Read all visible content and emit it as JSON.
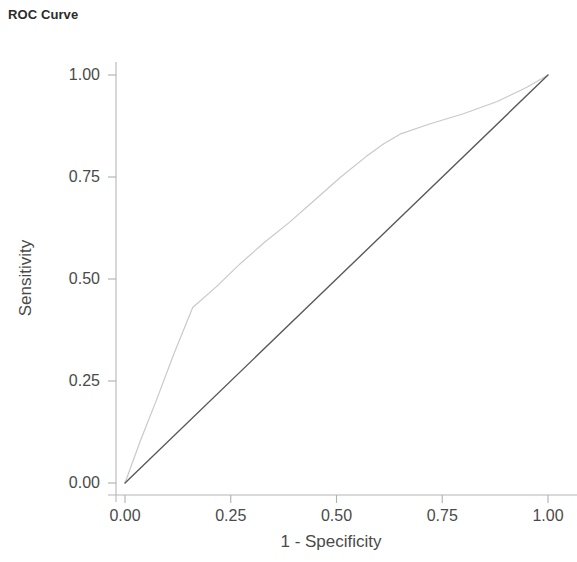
{
  "chart_data": {
    "type": "line",
    "title": "ROC Curve",
    "xlabel": "1 - Specificity",
    "ylabel": "Sensitivity",
    "xlim": [
      0,
      1
    ],
    "ylim": [
      0,
      1
    ],
    "grid": false,
    "legend": "none",
    "xticks": [
      "0.00",
      "0.25",
      "0.50",
      "0.75",
      "1.00"
    ],
    "xtick_values": [
      0,
      0.25,
      0.5,
      0.75,
      1
    ],
    "yticks": [
      "0.00",
      "0.25",
      "0.50",
      "0.75",
      "1.00"
    ],
    "ytick_values": [
      0,
      0.25,
      0.5,
      0.75,
      1
    ],
    "series": [
      {
        "name": "ROC curve",
        "color": "#c9c9c9",
        "width": 1.2,
        "x": [
          0.0,
          0.035,
          0.075,
          0.115,
          0.16,
          0.215,
          0.275,
          0.33,
          0.39,
          0.45,
          0.51,
          0.57,
          0.61,
          0.65,
          0.72,
          0.8,
          0.88,
          0.95,
          1.0
        ],
        "y": [
          0.0,
          0.1,
          0.205,
          0.315,
          0.43,
          0.48,
          0.54,
          0.59,
          0.64,
          0.695,
          0.75,
          0.8,
          0.83,
          0.855,
          0.88,
          0.905,
          0.935,
          0.97,
          1.0
        ]
      },
      {
        "name": "Reference line",
        "color": "#5a5a5a",
        "width": 1.4,
        "x": [
          0.0,
          1.0
        ],
        "y": [
          0.0,
          1.0
        ]
      }
    ],
    "axis_color": "#b6b6b6",
    "tick_color": "#b0b0b0"
  }
}
